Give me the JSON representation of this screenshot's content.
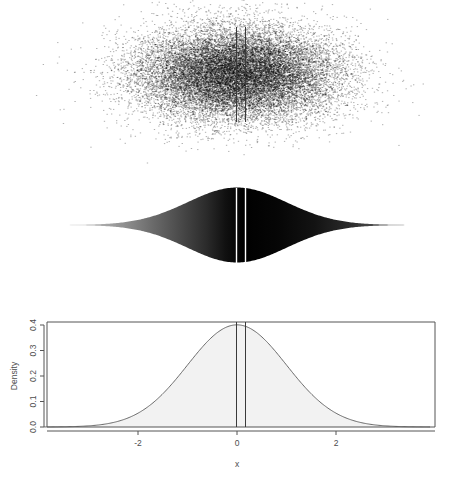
{
  "figure": {
    "title": "",
    "background": "#ffffff"
  },
  "chart_data": [
    {
      "id": "scatter-panel",
      "type": "scatter",
      "title": "",
      "xlabel": "",
      "ylabel": "",
      "xlim": [
        -3.9,
        3.9
      ],
      "ylim": [
        -1.0,
        1.0
      ],
      "grid": false,
      "legend": null,
      "n_points": 20000,
      "description": "Dense jittered point cloud of standard-normal sample, elliptical density, darkest near x = 0",
      "point_color": "#000000",
      "point_size": 0.6,
      "annotations": [
        {
          "name": "mean-line",
          "type": "vline",
          "x": 0.0,
          "color": "#3a3a3a"
        },
        {
          "name": "second-line",
          "type": "vline",
          "x": 0.18,
          "color": "#3a3a3a"
        }
      ]
    },
    {
      "id": "violin-panel",
      "type": "area",
      "title": "",
      "xlabel": "",
      "ylabel": "",
      "xlim": [
        -3.9,
        3.9
      ],
      "ylim": [
        -1.0,
        1.0
      ],
      "grid": false,
      "legend": null,
      "description": "Mirrored (violin) normal density filled with a grayscale gradient keyed to local density; black at the center, fading to white in the tails",
      "gradient": {
        "center": "#000000",
        "tails": "#ffffff"
      },
      "x": [
        -3.9,
        -3.5,
        -3.0,
        -2.5,
        -2.0,
        -1.5,
        -1.0,
        -0.5,
        0.0,
        0.5,
        1.0,
        1.5,
        2.0,
        2.5,
        3.0,
        3.5,
        3.9
      ],
      "density": [
        0.0002,
        0.0009,
        0.0044,
        0.0175,
        0.054,
        0.1295,
        0.242,
        0.3521,
        0.3989,
        0.3521,
        0.242,
        0.1295,
        0.054,
        0.0175,
        0.0044,
        0.0009,
        0.0002
      ],
      "annotations": [
        {
          "name": "mean-line",
          "type": "vline",
          "x": 0.0,
          "color": "#ffffff"
        },
        {
          "name": "second-line",
          "type": "vline",
          "x": 0.18,
          "color": "#ffffff"
        }
      ]
    },
    {
      "id": "density-panel",
      "type": "line",
      "title": "",
      "xlabel": "x",
      "ylabel": "Density",
      "xlim": [
        -3.9,
        3.9
      ],
      "ylim": [
        0.0,
        0.41
      ],
      "grid": false,
      "legend": null,
      "xticks": [
        -2,
        0,
        2
      ],
      "xticklabels": [
        "-2",
        "0",
        "2"
      ],
      "yticks": [
        0.0,
        0.1,
        0.2,
        0.3,
        0.4
      ],
      "yticklabels": [
        "0.0",
        "0.1",
        "0.2",
        "0.3",
        "0.4"
      ],
      "fill": "#f2f2f2",
      "line_color": "#5a5a5a",
      "x": [
        -3.9,
        -3.6,
        -3.3,
        -3.0,
        -2.7,
        -2.4,
        -2.1,
        -1.8,
        -1.5,
        -1.2,
        -0.9,
        -0.6,
        -0.3,
        0.0,
        0.3,
        0.6,
        0.9,
        1.2,
        1.5,
        1.8,
        2.1,
        2.4,
        2.7,
        3.0,
        3.3,
        3.6,
        3.9
      ],
      "y": [
        0.0002,
        0.0006,
        0.0017,
        0.0044,
        0.0104,
        0.0224,
        0.044,
        0.079,
        0.1295,
        0.1942,
        0.2661,
        0.3332,
        0.3814,
        0.3989,
        0.3814,
        0.3332,
        0.2661,
        0.1942,
        0.1295,
        0.079,
        0.044,
        0.0224,
        0.0104,
        0.0044,
        0.0017,
        0.0006,
        0.0002
      ],
      "annotations": [
        {
          "name": "mean-line",
          "type": "vline",
          "x": 0.0,
          "color": "#3a3a3a"
        },
        {
          "name": "second-line",
          "type": "vline",
          "x": 0.18,
          "color": "#3a3a3a"
        }
      ]
    }
  ],
  "axes": {
    "density": {
      "ylabel": "Density",
      "xlabel": "x",
      "xticklabels": [
        "-2",
        "0",
        "2"
      ],
      "yticklabels": [
        "0.0",
        "0.1",
        "0.2",
        "0.3",
        "0.4"
      ]
    }
  }
}
